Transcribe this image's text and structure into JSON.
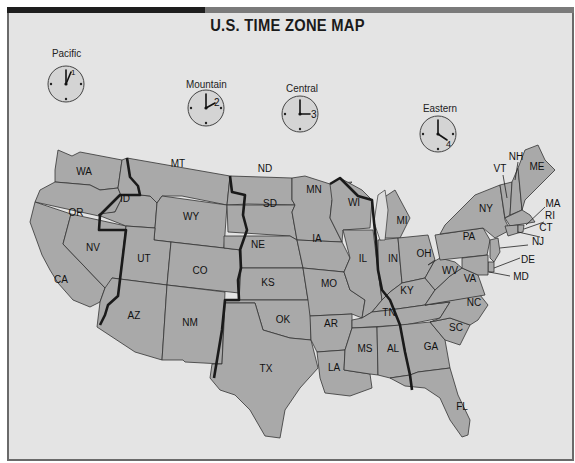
{
  "title": "U.S. TIME ZONE MAP",
  "colors": {
    "background": "#e4e4e4",
    "state_fill": "#a9a9a9",
    "lake_fill": "#dcdcdc",
    "border": "#333333",
    "timezone_line": "#1a1a1a",
    "bar_dark": "#1e1e1e",
    "bar_light": "#7a7a7a"
  },
  "clocks": [
    {
      "zone": "Pacific",
      "hour_label": "1",
      "icon": "clock-icon"
    },
    {
      "zone": "Mountain",
      "hour_label": "2",
      "icon": "clock-icon"
    },
    {
      "zone": "Central",
      "hour_label": "3",
      "icon": "clock-icon"
    },
    {
      "zone": "Eastern",
      "hour_label": "4",
      "icon": "clock-icon"
    }
  ],
  "states": {
    "WA": "WA",
    "OR": "OR",
    "CA": "CA",
    "NV": "NV",
    "ID": "ID",
    "MT": "MT",
    "WY": "WY",
    "UT": "UT",
    "AZ": "AZ",
    "CO": "CO",
    "NM": "NM",
    "ND": "ND",
    "SD": "SD",
    "NE": "NE",
    "KS": "KS",
    "OK": "OK",
    "TX": "TX",
    "MN": "MN",
    "IA": "IA",
    "MO": "MO",
    "AR": "AR",
    "LA": "LA",
    "WI": "WI",
    "IL": "IL",
    "MS": "MS",
    "AL": "AL",
    "TN": "TN",
    "KY": "KY",
    "MI": "MI",
    "IN": "IN",
    "OH": "OH",
    "GA": "GA",
    "FL": "FL",
    "SC": "SC",
    "NC": "NC",
    "VA": "VA",
    "WV": "WV",
    "PA": "PA",
    "NY": "NY",
    "VT": "VT",
    "NH": "NH",
    "ME": "ME",
    "MA": "MA",
    "RI": "RI",
    "CT": "CT",
    "NJ": "NJ",
    "DE": "DE",
    "MD": "MD"
  }
}
